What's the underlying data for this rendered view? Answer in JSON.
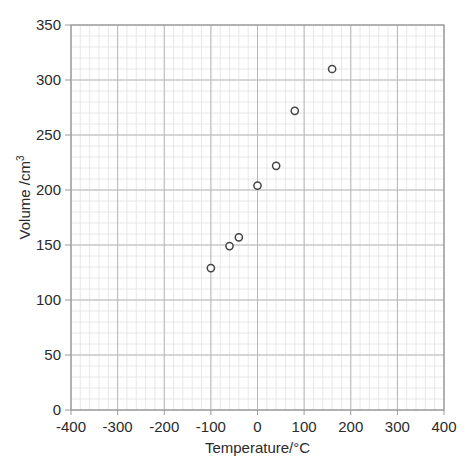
{
  "chart_data": {
    "type": "scatter",
    "title": "",
    "xlabel": "Temperature/°C",
    "ylabel": "Volume /cm³",
    "xlim": [
      -400,
      400
    ],
    "ylim": [
      0,
      350
    ],
    "x_ticks": [
      -400,
      -300,
      -200,
      -100,
      0,
      100,
      200,
      300,
      400
    ],
    "y_ticks": [
      0,
      50,
      100,
      150,
      200,
      250,
      300,
      350
    ],
    "x_minor_step": 20,
    "y_minor_step": 10,
    "grid": true,
    "legend": null,
    "series": [
      {
        "name": "Volume vs Temperature",
        "marker": "open-circle",
        "points": [
          {
            "x": -100,
            "y": 129
          },
          {
            "x": -60,
            "y": 149
          },
          {
            "x": -40,
            "y": 157
          },
          {
            "x": 0,
            "y": 204
          },
          {
            "x": 40,
            "y": 222
          },
          {
            "x": 80,
            "y": 272
          },
          {
            "x": 160,
            "y": 310
          }
        ]
      }
    ]
  },
  "colors": {
    "major_grid": "#b8b8b8",
    "minor_grid": "#e2e2e2",
    "axis": "#9a9a9a",
    "marker": "#444444",
    "text": "#2a2a2a"
  },
  "labels": {
    "xlabel": "Temperature/°C",
    "ylabel_main": "Volume /cm",
    "ylabel_sup": "3"
  }
}
